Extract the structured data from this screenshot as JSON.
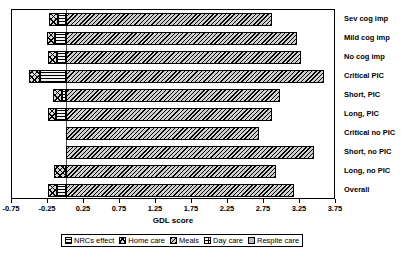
{
  "chart_data": {
    "type": "bar",
    "orientation": "horizontal",
    "stacked": true,
    "title": "",
    "xlabel": "GDL score",
    "ylabel": "",
    "xlim": [
      -0.75,
      3.75
    ],
    "xtick_step": 0.5,
    "xticks": [
      "-0.75",
      "-0.25",
      "0.25",
      "0.75",
      "1.25",
      "1.75",
      "2.25",
      "2.75",
      "3.25",
      "3.75"
    ],
    "xtick_values": [
      -0.75,
      -0.25,
      0.25,
      0.75,
      1.25,
      1.75,
      2.25,
      2.75,
      3.25,
      3.75
    ],
    "grid": false,
    "legend_position": "bottom",
    "categories": [
      "Sev cog imp",
      "Mild cog imp",
      "No cog imp",
      "Critical PIC",
      "Short, PIC",
      "Long, PIC",
      "Critical no PIC",
      "Short, no PIC",
      "Long, no PIC",
      "Overall"
    ],
    "series": [
      {
        "name": "NRCs effect",
        "pattern": "horizontal-lines",
        "values": [
          -0.11,
          -0.15,
          -0.13,
          -0.36,
          -0.05,
          -0.14,
          0.0,
          0.0,
          0.0,
          -0.13
        ]
      },
      {
        "name": "Home care",
        "pattern": "cross-hatch",
        "values": [
          -0.12,
          -0.12,
          -0.12,
          -0.15,
          -0.13,
          -0.11,
          0.0,
          0.0,
          -0.16,
          -0.12
        ]
      },
      {
        "name": "Meals",
        "pattern": "diagonal-hatch",
        "values": [
          2.86,
          3.21,
          3.27,
          3.58,
          2.97,
          2.86,
          2.68,
          3.45,
          2.91,
          3.16
        ]
      },
      {
        "name": "Day care",
        "pattern": "dotted",
        "values": [
          0.0,
          0.0,
          0.0,
          0.0,
          0.0,
          0.0,
          0.0,
          0.0,
          0.0,
          0.0
        ]
      },
      {
        "name": "Respite care",
        "pattern": "solid-light",
        "values": [
          0.0,
          0.0,
          0.0,
          0.0,
          0.0,
          0.0,
          0.0,
          0.0,
          0.0,
          0.0
        ]
      }
    ],
    "bar_totals": [
      2.63,
      2.94,
      3.02,
      3.07,
      2.79,
      2.61,
      2.68,
      3.45,
      2.75,
      2.91
    ],
    "legend_entries": [
      "NRCs effect",
      "Home care",
      "Meals",
      "Day care",
      "Respite care"
    ]
  },
  "legend": {
    "items": [
      {
        "label": "NRCs effect",
        "swatch": "nrcs-swatch"
      },
      {
        "label": "Home care",
        "swatch": "home-swatch"
      },
      {
        "label": "Meals",
        "swatch": "meals-swatch"
      },
      {
        "label": "Day care",
        "swatch": "day-swatch"
      },
      {
        "label": "Respite care",
        "swatch": "respite-swatch"
      }
    ]
  }
}
